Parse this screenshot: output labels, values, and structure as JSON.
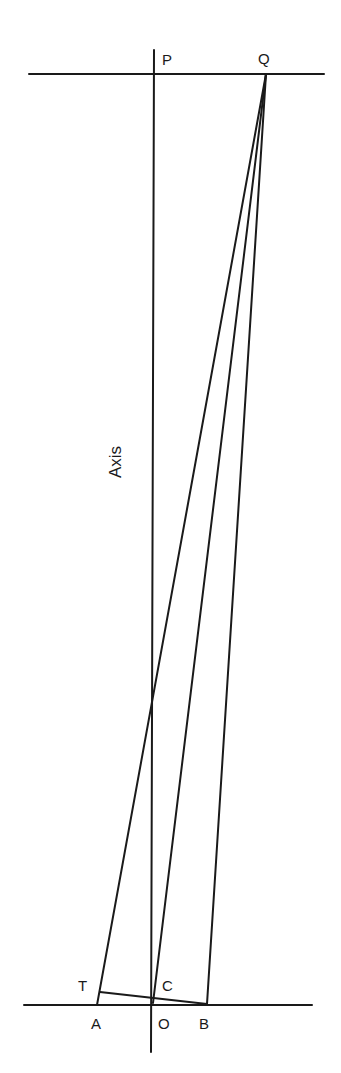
{
  "diagram": {
    "labels": {
      "P": "P",
      "Q": "Q",
      "T": "T",
      "C": "C",
      "A": "A",
      "O": "O",
      "B": "B",
      "axis": "Axis"
    },
    "points": {
      "P": [
        154,
        74
      ],
      "Q": [
        266,
        74
      ],
      "T": [
        100,
        992
      ],
      "C": [
        153,
        998
      ],
      "A": [
        97,
        1005
      ],
      "O": [
        153,
        1005
      ],
      "B": [
        207,
        1004
      ]
    },
    "lines": [
      {
        "name": "top-horizontal",
        "from": [
          29,
          74
        ],
        "to": [
          324,
          74
        ]
      },
      {
        "name": "bottom-horizontal",
        "from": [
          24,
          1005
        ],
        "to": [
          312,
          1005
        ]
      },
      {
        "name": "axis",
        "from": [
          154,
          50
        ],
        "to": [
          150,
          1052
        ]
      },
      {
        "name": "Q-to-A",
        "from": [
          266,
          74
        ],
        "to": [
          97,
          1005
        ]
      },
      {
        "name": "Q-to-C",
        "from": [
          266,
          74
        ],
        "to": [
          153,
          1003
        ]
      },
      {
        "name": "Q-to-B",
        "from": [
          266,
          74
        ],
        "to": [
          207,
          1004
        ]
      },
      {
        "name": "T-to-B",
        "from": [
          100,
          992
        ],
        "to": [
          207,
          1004
        ]
      }
    ],
    "stroke_color": "#1a1a1a"
  }
}
